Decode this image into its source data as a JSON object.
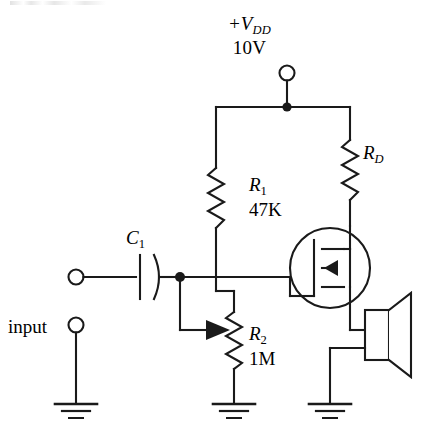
{
  "figure": {
    "type": "circuit-schematic",
    "width": 437,
    "height": 443,
    "background_color": "#ffffff",
    "line_color": "#1a1a1a"
  },
  "labels": {
    "supply_symbol": "+V",
    "supply_subscript": "DD",
    "supply_voltage": "10V",
    "rd_symbol": "R",
    "rd_subscript": "D",
    "r1_symbol": "R",
    "r1_subscript": "1",
    "r1_value": "47K",
    "r2_symbol": "R",
    "r2_subscript": "2",
    "r2_value": "1M",
    "c1_symbol": "C",
    "c1_subscript": "1",
    "input_label": "input"
  },
  "components": [
    {
      "name": "supply-terminal",
      "kind": "terminal-circle",
      "label": "+V_DD 10V",
      "x": 287,
      "y": 73
    },
    {
      "name": "resistor-rd",
      "kind": "resistor",
      "designator": "R_D",
      "value": "",
      "orientation": "vertical",
      "x": 350,
      "y_top": 140,
      "y_bottom": 200
    },
    {
      "name": "resistor-r1",
      "kind": "resistor",
      "designator": "R_1",
      "value": "47K",
      "orientation": "vertical",
      "x": 216,
      "y_top": 168,
      "y_bottom": 228
    },
    {
      "name": "resistor-r2",
      "kind": "potentiometer",
      "designator": "R_2",
      "value": "1M",
      "orientation": "vertical",
      "has_wiper": true,
      "x": 234,
      "y_top": 312,
      "y_bottom": 372
    },
    {
      "name": "capacitor-c1",
      "kind": "capacitor-polarized",
      "designator": "C_1",
      "value": "",
      "orientation": "horizontal",
      "x": 152,
      "y": 277
    },
    {
      "name": "mosfet-q1",
      "kind": "mosfet-n-enhancement",
      "enclosed_in_circle": true,
      "terminals": [
        "gate",
        "drain",
        "source"
      ],
      "x": 330,
      "y": 268
    },
    {
      "name": "speaker",
      "kind": "loudspeaker",
      "x": 380,
      "y": 340
    },
    {
      "name": "input-terminal-top",
      "kind": "terminal-circle",
      "x": 76,
      "y": 277
    },
    {
      "name": "input-terminal-bottom",
      "kind": "terminal-circle",
      "x": 76,
      "y": 325
    },
    {
      "name": "ground-input",
      "kind": "ground",
      "x": 76,
      "y": 415
    },
    {
      "name": "ground-r2",
      "kind": "ground",
      "x": 234,
      "y": 415
    },
    {
      "name": "ground-speaker",
      "kind": "ground",
      "x": 330,
      "y": 415
    }
  ],
  "junctions": [
    {
      "name": "supply-rail-node",
      "x": 287,
      "y": 107
    },
    {
      "name": "gate-input-node",
      "x": 180,
      "y": 277
    }
  ]
}
